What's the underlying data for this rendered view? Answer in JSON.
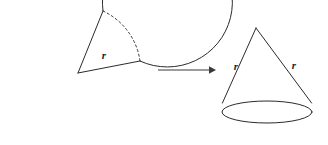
{
  "figure": {
    "background_color": "#ffffff",
    "stroke_color": "#2b2b2b",
    "label_color": "#262626",
    "width": 328,
    "height": 145
  },
  "circle_figure": {
    "name": "circle-with-sector-removed",
    "center": {
      "x": 78,
      "y": 73
    },
    "radius": 65,
    "radius_label": "r",
    "radius_label_position": {
      "x": 104,
      "y": 59
    },
    "cut_edges": [
      {
        "from": {
          "x": 78,
          "y": 73
        },
        "to": {
          "x": 103,
          "y": 11
        }
      },
      {
        "from": {
          "x": 78,
          "y": 73
        },
        "to": {
          "x": 140,
          "y": 61
        }
      }
    ],
    "dashed_arc": {
      "description": "missing sector arc",
      "from": {
        "x": 103,
        "y": 11
      },
      "to": {
        "x": 140,
        "y": 61
      }
    }
  },
  "arrow": {
    "name": "transformation-arrow",
    "from": {
      "x": 158,
      "y": 70
    },
    "to": {
      "x": 216,
      "y": 70
    },
    "direction": "right"
  },
  "cone_figure": {
    "name": "cone",
    "apex": {
      "x": 256,
      "y": 28
    },
    "base_center": {
      "x": 267,
      "y": 112
    },
    "base_rx": 45,
    "base_ry": 11,
    "slant_labels": [
      {
        "text": "r",
        "x": 236,
        "y": 70
      },
      {
        "text": "r",
        "x": 294,
        "y": 69
      }
    ]
  },
  "labels": {
    "radius": "r"
  }
}
